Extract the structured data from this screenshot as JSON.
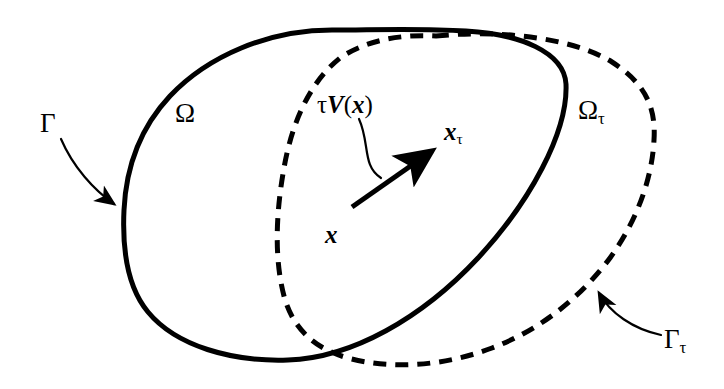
{
  "figure": {
    "width": 724,
    "height": 389,
    "background_color": "#ffffff",
    "stroke_color": "#000000"
  },
  "labels": {
    "omega": "Ω",
    "omega_tau_base": "Ω",
    "omega_tau_sub": "τ",
    "gamma": "Γ",
    "gamma_tau_base": "Γ",
    "gamma_tau_sub": "τ",
    "tau_symbol": "τ",
    "velocity_field_v": "V",
    "velocity_field_open_paren": "(",
    "velocity_field_arg": "x",
    "velocity_field_close_paren": ")",
    "point_x": "x",
    "point_x_tau_base": "x",
    "point_x_tau_sub": "τ"
  },
  "shapes": {
    "reference_domain_boundary": {
      "name": "Gamma",
      "style": "solid",
      "stroke_width": 5,
      "path": "M 332 30 C 268 30 208 56 170 96 C 140 128 126 168 124 210 C 122 252 128 288 148 312 C 176 346 232 362 288 360 C 352 358 422 318 478 258 C 530 202 568 132 566 84 C 564 52 520 34 466 31 C 420 28 372 30 332 30 Z"
    },
    "perturbed_domain_boundary": {
      "name": "Gamma_tau",
      "style": "dashed",
      "stroke_width": 5,
      "dash_pattern": "13 9",
      "path": "M 436 36 C 494 30 570 36 612 62 C 646 84 656 108 654 140 C 652 180 636 222 610 258 C 580 298 540 330 492 348 C 444 366 392 370 348 358 C 312 348 292 326 284 296 C 274 258 276 212 284 168 C 292 122 310 82 340 58 C 366 40 402 34 436 36 Z"
    },
    "displacement_arrow": {
      "name": "tau-V-vector",
      "from": [
        352,
        207
      ],
      "to": [
        438,
        147
      ],
      "stroke_width": 5
    },
    "gamma_leader": {
      "name": "gamma-leader-arrow",
      "path": "M 62 140 C 74 166 96 192 120 206",
      "stroke_width": 2
    },
    "gamma_tau_leader": {
      "name": "gamma-tau-leader-arrow",
      "path": "M 660 336 C 632 330 608 312 596 290",
      "stroke_width": 2
    },
    "tauv_leader": {
      "name": "tau-V-leader-line",
      "path": "M 358 120 C 368 142 364 164 380 178",
      "stroke_width": 2
    }
  }
}
